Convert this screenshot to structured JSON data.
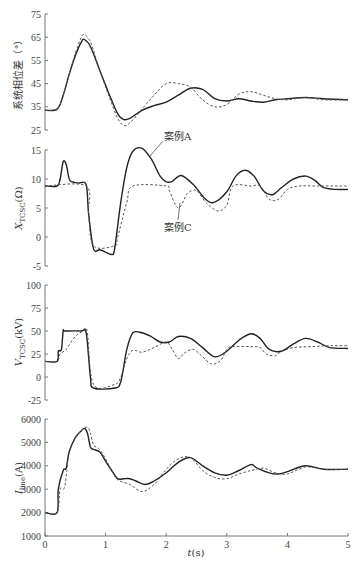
{
  "chart_data": [
    {
      "type": "line",
      "title": "",
      "xlabel": "",
      "ylabel": "系统相位差（°）",
      "xlim": [
        0,
        5
      ],
      "ylim": [
        25,
        75
      ],
      "yticks": [
        25,
        35,
        45,
        55,
        65,
        75
      ],
      "grid": false,
      "series": [
        {
          "name": "案例A",
          "style": "solid",
          "x": [
            0,
            0.2,
            0.3,
            0.4,
            0.5,
            0.6,
            0.65,
            0.75,
            0.9,
            1.05,
            1.2,
            1.3,
            1.4,
            1.6,
            1.8,
            2.0,
            2.2,
            2.4,
            2.6,
            2.8,
            3.0,
            3.2,
            3.4,
            3.6,
            3.8,
            4.0,
            4.3,
            4.6,
            5.0
          ],
          "y": [
            33.5,
            34,
            40,
            49,
            57,
            63,
            64,
            61,
            51,
            41,
            32,
            29.5,
            30,
            33.5,
            35.5,
            37,
            40,
            43,
            42.5,
            38.5,
            37.5,
            38.5,
            37.5,
            37,
            38,
            38.5,
            39,
            38.5,
            38
          ]
        },
        {
          "name": "案例C",
          "style": "dashed",
          "x": [
            0,
            0.2,
            0.3,
            0.4,
            0.5,
            0.6,
            0.65,
            0.75,
            0.9,
            1.05,
            1.2,
            1.3,
            1.4,
            1.6,
            1.8,
            2.0,
            2.2,
            2.4,
            2.6,
            2.8,
            3.0,
            3.2,
            3.4,
            3.6,
            3.8,
            4.0,
            4.3,
            4.6,
            5.0
          ],
          "y": [
            33.5,
            34,
            40,
            49,
            58,
            65,
            66,
            63,
            51,
            40,
            30,
            27,
            28,
            34,
            40,
            45,
            45,
            43.5,
            38,
            35,
            36,
            40.5,
            41.5,
            40,
            38.5,
            38,
            39,
            38,
            38
          ]
        }
      ]
    },
    {
      "type": "line",
      "ylabel": "X_TCSC(Ω)",
      "xlim": [
        0,
        5
      ],
      "ylim": [
        -5,
        15
      ],
      "yticks": [
        -5,
        0,
        5,
        10,
        15
      ],
      "annotations": [
        {
          "text": "案例A",
          "x": 1.8,
          "y": 12
        },
        {
          "text": "案例C",
          "x": 2.1,
          "y": 2
        }
      ],
      "series": [
        {
          "name": "案例A",
          "style": "solid",
          "x": [
            0,
            0.2,
            0.25,
            0.3,
            0.35,
            0.4,
            0.45,
            0.55,
            0.68,
            0.72,
            0.8,
            0.9,
            1.0,
            1.1,
            1.15,
            1.25,
            1.35,
            1.45,
            1.6,
            1.75,
            1.9,
            2.0,
            2.1,
            2.25,
            2.45,
            2.65,
            2.8,
            3.0,
            3.15,
            3.3,
            3.45,
            3.6,
            3.75,
            3.9,
            4.1,
            4.3,
            4.45,
            4.6,
            4.8,
            5.0
          ],
          "y": [
            8.8,
            8.8,
            10,
            13,
            12.5,
            10,
            9.5,
            9.3,
            9,
            4,
            -2,
            -2.2,
            -2.6,
            -3,
            -2,
            6,
            12,
            14.8,
            15.3,
            13.5,
            10.5,
            9.5,
            9.6,
            10.6,
            9,
            6.5,
            6,
            7.8,
            10.5,
            11.5,
            10.5,
            8,
            7.3,
            8.5,
            10,
            10.5,
            9.8,
            8.5,
            8.2,
            8.2
          ]
        },
        {
          "name": "案例C",
          "style": "dashed",
          "x": [
            0,
            0.68,
            0.72,
            0.8,
            1.15,
            1.2,
            1.35,
            1.45,
            2.0,
            2.05,
            2.2,
            2.35,
            2.5,
            2.65,
            2.85,
            3.0,
            3.1,
            3.4,
            3.55,
            3.7,
            3.85,
            4.0,
            4.2,
            4.5,
            5.0
          ],
          "y": [
            8.8,
            8.8,
            4,
            -1.5,
            -1.5,
            0,
            6,
            8.8,
            8.8,
            8,
            5,
            7.5,
            8,
            6,
            4.5,
            5.5,
            8.8,
            8.8,
            8.8,
            6.5,
            6.5,
            8.2,
            8.8,
            8.8,
            8.8
          ]
        }
      ]
    },
    {
      "type": "line",
      "ylabel": "V_TCSC(kV)",
      "xlim": [
        0,
        5
      ],
      "ylim": [
        -25,
        100
      ],
      "yticks": [
        -25,
        0,
        25,
        50,
        75,
        100
      ],
      "series": [
        {
          "name": "案例A",
          "style": "solid",
          "x": [
            0,
            0.2,
            0.22,
            0.27,
            0.3,
            0.33,
            0.6,
            0.68,
            0.75,
            0.8,
            1.15,
            1.25,
            1.35,
            1.45,
            1.6,
            1.75,
            1.9,
            2.05,
            2.2,
            2.4,
            2.6,
            2.8,
            3.0,
            3.2,
            3.4,
            3.55,
            3.7,
            3.9,
            4.1,
            4.3,
            4.5,
            4.7,
            5.0
          ],
          "y": [
            17,
            17,
            28,
            30,
            50,
            50,
            50,
            48,
            0,
            -12,
            -12,
            -5,
            30,
            48,
            48,
            44,
            38,
            38,
            44,
            42,
            32,
            22,
            28,
            40,
            47,
            42,
            30,
            28,
            36,
            42,
            38,
            32,
            31
          ]
        },
        {
          "name": "案例C",
          "style": "dashed",
          "x": [
            0,
            0.2,
            0.25,
            0.35,
            0.45,
            0.55,
            0.65,
            0.7,
            0.8,
            1.15,
            1.25,
            1.35,
            1.45,
            1.6,
            1.8,
            2.0,
            2.1,
            2.2,
            2.3,
            2.45,
            2.6,
            2.75,
            2.9,
            3.0,
            3.1,
            3.4,
            3.55,
            3.65,
            3.8,
            3.9,
            4.1,
            4.4,
            4.7,
            5.0
          ],
          "y": [
            17,
            17,
            25,
            30,
            40,
            47,
            50,
            48,
            -8,
            -8,
            0,
            20,
            29,
            27,
            32,
            38,
            30,
            20,
            26,
            30,
            22,
            14,
            18,
            30,
            33,
            33,
            32,
            25,
            23,
            28,
            32,
            33,
            34,
            34
          ]
        }
      ]
    },
    {
      "type": "line",
      "xlabel": "t(s)",
      "ylabel": "I_line(A)",
      "xlim": [
        0,
        5
      ],
      "ylim": [
        1000,
        6000
      ],
      "yticks": [
        1000,
        2000,
        3000,
        4000,
        5000,
        6000
      ],
      "xticks": [
        0,
        1,
        2,
        3,
        4,
        5
      ],
      "series": [
        {
          "name": "案例A",
          "style": "solid",
          "x": [
            0,
            0.2,
            0.22,
            0.3,
            0.35,
            0.4,
            0.5,
            0.6,
            0.65,
            0.7,
            0.75,
            0.8,
            0.9,
            1.0,
            1.1,
            1.2,
            1.3,
            1.4,
            1.5,
            1.65,
            1.8,
            2.0,
            2.2,
            2.4,
            2.6,
            2.8,
            3.0,
            3.2,
            3.4,
            3.5,
            3.7,
            3.85,
            4.0,
            4.3,
            4.6,
            5.0
          ],
          "y": [
            2000,
            2000,
            3000,
            3800,
            3900,
            4600,
            5200,
            5500,
            5600,
            5400,
            4800,
            4700,
            4600,
            4200,
            3800,
            3450,
            3450,
            3450,
            3350,
            3200,
            3350,
            3700,
            4150,
            4350,
            4000,
            3700,
            3600,
            3800,
            4050,
            3900,
            3700,
            3650,
            3750,
            4000,
            3850,
            3850
          ]
        },
        {
          "name": "案例C",
          "style": "dashed",
          "x": [
            0,
            0.2,
            0.25,
            0.32,
            0.36,
            0.4,
            0.5,
            0.6,
            0.7,
            0.75,
            0.8,
            0.9,
            1.0,
            1.1,
            1.2,
            1.4,
            1.6,
            1.8,
            2.0,
            2.2,
            2.4,
            2.6,
            2.8,
            3.0,
            3.2,
            3.4,
            3.6,
            3.8,
            4.0,
            4.3,
            4.6,
            5.0
          ],
          "y": [
            2000,
            2000,
            3000,
            3050,
            3800,
            4600,
            5200,
            5500,
            5650,
            5400,
            4900,
            4700,
            4300,
            3800,
            3400,
            3200,
            2900,
            3200,
            3850,
            4300,
            4350,
            3800,
            3500,
            3450,
            3650,
            3800,
            3900,
            3700,
            3650,
            3950,
            3850,
            3850
          ]
        }
      ]
    }
  ],
  "labels": {
    "panel1_ylabel": "系统相位差（°）",
    "panel2_ylabel_main": "X",
    "panel2_ylabel_sub": "TCSC",
    "panel2_ylabel_unit": "(Ω)",
    "panel3_ylabel_main": "V",
    "panel3_ylabel_sub": "TCSC",
    "panel3_ylabel_unit": "(kV)",
    "panel4_ylabel_main": "I",
    "panel4_ylabel_sub": "line",
    "panel4_ylabel_unit": "(A)",
    "xlabel_var": "t",
    "xlabel_unit": "(s)",
    "anno_a": "案例A",
    "anno_c": "案例C"
  }
}
